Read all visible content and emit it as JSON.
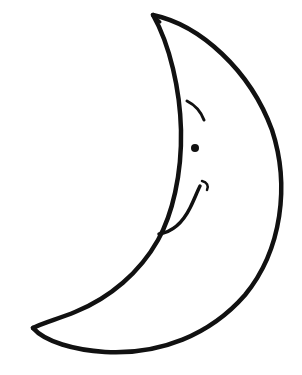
{
  "illustration": {
    "subject": "crescent moon with face",
    "stroke_color": "#111111",
    "background_color": "#ffffff",
    "parts": [
      "moon-outline",
      "eyebrow",
      "eye",
      "smile"
    ]
  }
}
